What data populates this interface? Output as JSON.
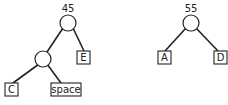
{
  "trees": [
    {
      "root_weight": "45",
      "leaves": [
        "C",
        "space",
        "E"
      ]
    },
    {
      "root_weight": "55",
      "leaves": [
        "A",
        "D"
      ]
    }
  ],
  "colors": {
    "stroke": "#222222",
    "background": "#ffffff"
  }
}
